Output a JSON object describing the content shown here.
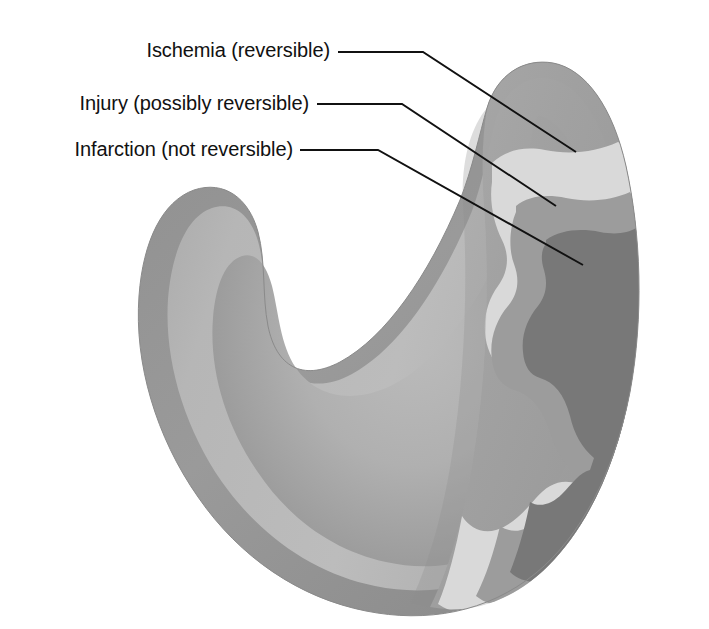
{
  "figure": {
    "background_color": "#ffffff"
  },
  "labels": [
    {
      "id": "ischemia",
      "text": "Ischemia (reversible)",
      "text_anchor_x": 330,
      "text_baseline_y": 57,
      "leader": "M 338 52 L 423 52 L 576 152",
      "target_zone": "ischemia-band",
      "swatch_color": "#d9d9d9"
    },
    {
      "id": "injury",
      "text": "Injury (possibly reversible)",
      "text_anchor_x": 309,
      "text_baseline_y": 110,
      "leader": "M 317 104 L 402 104 L 556 206",
      "target_zone": "injury-band",
      "swatch_color": "#9c9c9c"
    },
    {
      "id": "infarction",
      "text": "Infarction (not reversible)",
      "text_anchor_x": 293,
      "text_baseline_y": 156,
      "leader": "M 300 150 L 378 150 L 583 265",
      "target_zone": "infarct-core",
      "swatch_color": "#787878"
    }
  ],
  "zones": [
    {
      "name": "Ischemia (reversible)",
      "color": "#d9d9d9",
      "depth": "outermost",
      "order": 1
    },
    {
      "name": "Injury (possibly reversible)",
      "color": "#9c9c9c",
      "depth": "intermediate",
      "order": 2
    },
    {
      "name": "Infarction (not reversible)",
      "color": "#787878",
      "depth": "innermost core",
      "order": 3
    }
  ],
  "anatomy": {
    "outer_wall_color": "#9a9a9a",
    "myocardium_color": "#b4b4b4",
    "cavity_color": "#a3a3a3",
    "cavity_highlight_color": "#b9b9b9",
    "cut_face_color": "#a0a0a0",
    "outline_color": "#8d8d8d"
  }
}
